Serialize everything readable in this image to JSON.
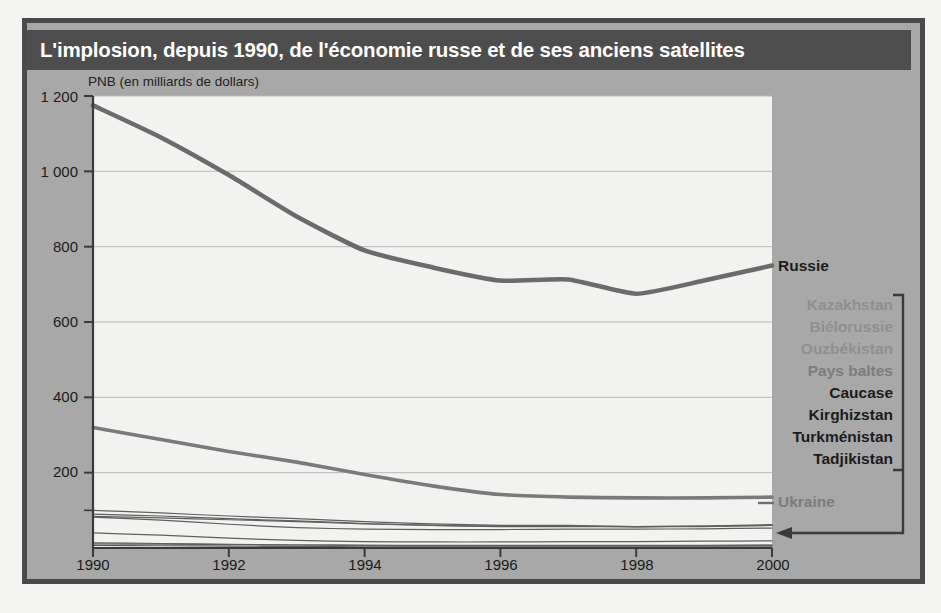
{
  "title": "L'implosion, depuis 1990, de l'économie russe et de ses anciens satellites",
  "axis_caption": "PNB (en milliards de dollars)",
  "legend": {
    "russie": "Russie",
    "ukraine": "Ukraine",
    "group": [
      "Kazakhstan",
      "Biélorussie",
      "Ouzbékistan",
      "Pays baltes",
      "Caucase",
      "Kirghizstan",
      "Turkménistan",
      "Tadjikistan"
    ]
  },
  "colors": {
    "frame": "#4a4a4a",
    "panel": "#a8a8a8",
    "title_band": "#4d4d4d",
    "title_text": "#ffffff",
    "plot_bg": "#f2f2f0",
    "line_russie": "#6b6b6b",
    "line_ukraine": "#7a7a7a",
    "line_minor": "#5f5f5f",
    "gridline": "#b9b9b9",
    "axis": "#3a3a3a"
  },
  "chart_data": {
    "type": "line",
    "title": "L'implosion, depuis 1990, de l'économie russe et de ses anciens satellites",
    "xlabel": "",
    "ylabel": "PNB (en milliards de dollars)",
    "xlim": [
      1990,
      2000
    ],
    "ylim": [
      0,
      1200
    ],
    "yticks": [
      200,
      400,
      600,
      800,
      1000,
      1200
    ],
    "ytick_labels": [
      "200",
      "400",
      "600",
      "800",
      "1 000",
      "1 200"
    ],
    "xticks": [
      1990,
      1992,
      1994,
      1996,
      1998,
      2000
    ],
    "xtick_labels": [
      "1990",
      "1992",
      "1994",
      "1996",
      "1998",
      "2000"
    ],
    "grid": "horizontal",
    "legend_position": "right",
    "x": [
      1990,
      1991,
      1992,
      1993,
      1994,
      1995,
      1996,
      1997,
      1998,
      1999,
      2000
    ],
    "series": [
      {
        "name": "Russie",
        "values": [
          1175,
          1090,
          990,
          880,
          790,
          745,
          710,
          713,
          675,
          710,
          750
        ],
        "emphasis": "strong"
      },
      {
        "name": "Ukraine",
        "values": [
          320,
          288,
          256,
          228,
          195,
          165,
          142,
          135,
          133,
          133,
          135
        ],
        "emphasis": "strong"
      },
      {
        "name": "Kazakhstan",
        "values": [
          100,
          93,
          85,
          78,
          70,
          64,
          60,
          60,
          57,
          58,
          62
        ],
        "emphasis": "minor"
      },
      {
        "name": "Biélorussie",
        "values": [
          90,
          85,
          78,
          72,
          65,
          60,
          57,
          57,
          56,
          57,
          60
        ],
        "emphasis": "minor"
      },
      {
        "name": "Ouzbékistan",
        "values": [
          84,
          80,
          75,
          70,
          64,
          60,
          58,
          58,
          57,
          58,
          60
        ],
        "emphasis": "minor"
      },
      {
        "name": "Pays baltes",
        "values": [
          82,
          74,
          63,
          54,
          50,
          49,
          49,
          50,
          50,
          51,
          53
        ],
        "emphasis": "minor"
      },
      {
        "name": "Caucase",
        "values": [
          40,
          34,
          26,
          20,
          17,
          16,
          16,
          17,
          17,
          18,
          19
        ],
        "emphasis": "minor"
      },
      {
        "name": "Kirghizstan",
        "values": [
          14,
          12,
          10,
          8,
          7,
          7,
          7,
          7,
          7,
          7,
          8
        ],
        "emphasis": "minor"
      },
      {
        "name": "Turkménistan",
        "values": [
          11,
          10,
          9,
          8,
          7,
          6,
          6,
          6,
          6,
          6,
          7
        ],
        "emphasis": "minor"
      },
      {
        "name": "Tadjikistan",
        "values": [
          7,
          6,
          5,
          4,
          3,
          3,
          3,
          3,
          3,
          3,
          3
        ],
        "emphasis": "minor"
      }
    ]
  }
}
